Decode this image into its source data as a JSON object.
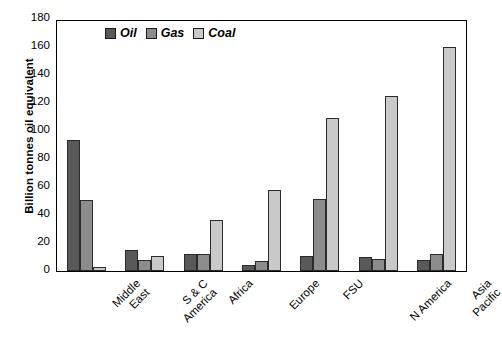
{
  "chart_data": {
    "type": "bar",
    "title": "",
    "xlabel": "",
    "ylabel": "Billion tonnes oil equivalent",
    "ylim": [
      0,
      180
    ],
    "yticks": [
      0,
      20,
      40,
      60,
      80,
      100,
      120,
      140,
      160,
      180
    ],
    "grid": false,
    "legend_position": "top-left-inside",
    "categories": [
      "Middle East",
      "S & C America",
      "Africa",
      "Europe",
      "FSU",
      "N America",
      "Asia Pacific"
    ],
    "category_lines": [
      [
        "Middle",
        "East"
      ],
      [
        "S & C",
        "America"
      ],
      [
        "Africa"
      ],
      [
        "Europe"
      ],
      [
        "FSU"
      ],
      [
        "N America"
      ],
      [
        "Asia",
        "Pacific"
      ]
    ],
    "series": [
      {
        "name": "Oil",
        "color": "#595959",
        "values": [
          94,
          15,
          12,
          4,
          11,
          10,
          8
        ]
      },
      {
        "name": "Gas",
        "color": "#8c8c8c",
        "values": [
          51,
          8,
          12,
          7,
          52,
          9,
          12
        ]
      },
      {
        "name": "Coal",
        "color": "#c9c9c9",
        "values": [
          3,
          11,
          37,
          58,
          110,
          126,
          161
        ]
      }
    ]
  }
}
